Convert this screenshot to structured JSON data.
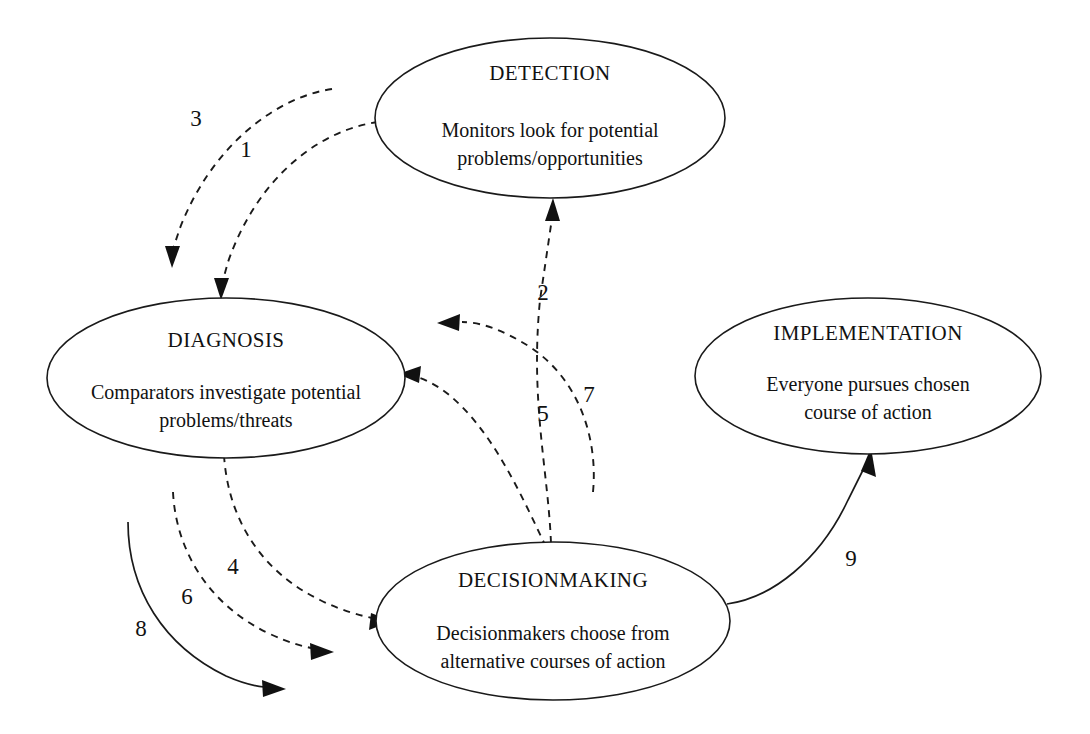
{
  "diagram": {
    "background_color": "#ffffff",
    "line_color": "#1a1a1a",
    "text_color": "#111111",
    "nodes": [
      {
        "id": "detection",
        "title": "DETECTION",
        "desc_line1": "Monitors look for potential",
        "desc_line2": "problems/opportunities",
        "cx": 550,
        "cy": 118,
        "rx": 175,
        "ry": 80
      },
      {
        "id": "diagnosis",
        "title": "DIAGNOSIS",
        "desc_line1": "Comparators investigate potential",
        "desc_line2": "problems/threats",
        "cx": 226,
        "cy": 378,
        "rx": 179,
        "ry": 80
      },
      {
        "id": "decisionmaking",
        "title": "DECISIONMAKING",
        "desc_line1": "Decisionmakers choose from",
        "desc_line2": "alternative courses of action",
        "cx": 553,
        "cy": 621,
        "rx": 177,
        "ry": 79
      },
      {
        "id": "implementation",
        "title": "IMPLEMENTATION",
        "desc_line1": "Everyone pursues chosen",
        "desc_line2": "course of action",
        "cx": 868,
        "cy": 376,
        "rx": 173,
        "ry": 78
      }
    ],
    "edges": [
      {
        "id": "edge-1",
        "label": "1",
        "style": "dashed",
        "from": "detection",
        "to": "diagnosis",
        "label_x": 246,
        "label_y": 157
      },
      {
        "id": "edge-2",
        "label": "2",
        "style": "dashed",
        "from": "decisionmaking",
        "to": "detection",
        "label_x": 543,
        "label_y": 300
      },
      {
        "id": "edge-3",
        "label": "3",
        "style": "dashed",
        "from": "detection",
        "to": "diagnosis",
        "label_x": 196,
        "label_y": 126
      },
      {
        "id": "edge-4",
        "label": "4",
        "style": "dashed",
        "from": "diagnosis",
        "to": "decisionmaking",
        "label_x": 233,
        "label_y": 574
      },
      {
        "id": "edge-5",
        "label": "5",
        "style": "dashed",
        "from": "decisionmaking",
        "to": "diagnosis",
        "label_x": 543,
        "label_y": 421
      },
      {
        "id": "edge-6",
        "label": "6",
        "style": "dashed",
        "from": "diagnosis",
        "to": "decisionmaking",
        "label_x": 187,
        "label_y": 604
      },
      {
        "id": "edge-7",
        "label": "7",
        "style": "dashed",
        "from": "decisionmaking",
        "to": "diagnosis",
        "label_x": 589,
        "label_y": 402
      },
      {
        "id": "edge-8",
        "label": "8",
        "style": "solid",
        "from": "diagnosis",
        "to": "decisionmaking",
        "label_x": 141,
        "label_y": 636
      },
      {
        "id": "edge-9",
        "label": "9",
        "style": "solid",
        "from": "decisionmaking",
        "to": "implementation",
        "label_x": 851,
        "label_y": 566
      }
    ]
  }
}
